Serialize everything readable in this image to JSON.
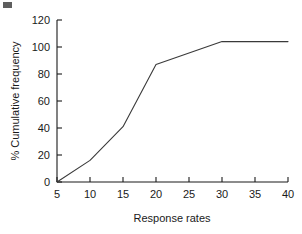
{
  "chart_data": {
    "type": "line",
    "title": "",
    "subtitle": "",
    "xlabel": "Response rates",
    "ylabel": "% Cumulative frequency",
    "xlim": [
      5,
      40
    ],
    "ylim": [
      0,
      120
    ],
    "xticks": [
      5,
      10,
      15,
      20,
      25,
      30,
      35,
      40
    ],
    "yticks": [
      0,
      20,
      40,
      60,
      80,
      100,
      120
    ],
    "xtick_labels": [
      "5",
      "10",
      "15",
      "20",
      "25",
      "30",
      "35",
      "40"
    ],
    "ytick_labels": [
      "0",
      "20",
      "40",
      "60",
      "80",
      "100",
      "120"
    ],
    "grid": false,
    "legend": false,
    "legend_position": "none",
    "line_color": "#3a3a3a",
    "line_width": 1,
    "markers": false,
    "x": [
      5,
      10,
      15,
      20,
      30,
      40
    ],
    "values": [
      0,
      16,
      41,
      87,
      104,
      104
    ],
    "series": [
      {
        "name": "% Cumulative frequency",
        "x": [
          5,
          10,
          15,
          20,
          30,
          40
        ],
        "values": [
          0,
          16,
          41,
          87,
          104,
          104
        ]
      }
    ],
    "annotations": []
  },
  "figure": {
    "background_color": "#ffffff",
    "axis_color": "#1a1a1a",
    "text_color": "#1a1a1a"
  }
}
